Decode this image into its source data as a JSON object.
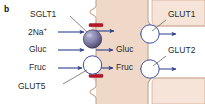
{
  "figure": {
    "panel_letter": "b",
    "type": "cell-transport-diagram"
  },
  "colors": {
    "cell_fill": "#f0d8c8",
    "cell_fill_light": "#f6e4d8",
    "membrane_outline": "#c9a48c",
    "arrow_blue": "#2b3f8c",
    "transporter_stroke": "#3c4fa0",
    "transporter_fill": "#ffffff",
    "sglt1_fill": "#8d8ab4",
    "sglt1_dark": "#4a4668",
    "tight_junction": "#b5172a",
    "text": "#2b2b2b",
    "leader_line": "#555555"
  },
  "labels": {
    "apical": {
      "sglt1": "SGLT1",
      "glut5": "GLUT5",
      "sodium": "2Na",
      "sodium_charge": "+",
      "glucose_out": "Gluc",
      "fructose_out": "Fruc"
    },
    "cytoplasm": {
      "glucose_in": "Gluc",
      "fructose_in": "Fruc"
    },
    "basolateral": {
      "glut1": "GLUT1",
      "glut2": "GLUT2"
    }
  },
  "transporters": [
    {
      "name": "SGLT1",
      "membrane": "apical",
      "style": "sphere",
      "substrates": [
        "2Na+",
        "Gluc"
      ]
    },
    {
      "name": "GLUT5",
      "membrane": "apical",
      "style": "circle",
      "substrates": [
        "Fruc"
      ]
    },
    {
      "name": "GLUT1",
      "membrane": "basolateral",
      "style": "circle",
      "substrates": [
        "Gluc"
      ]
    },
    {
      "name": "GLUT2",
      "membrane": "basolateral",
      "style": "circle",
      "substrates": [
        "Gluc",
        "Fruc"
      ]
    }
  ],
  "tight_junctions": [
    {
      "position": "apical-top"
    },
    {
      "position": "apical-bottom"
    }
  ]
}
